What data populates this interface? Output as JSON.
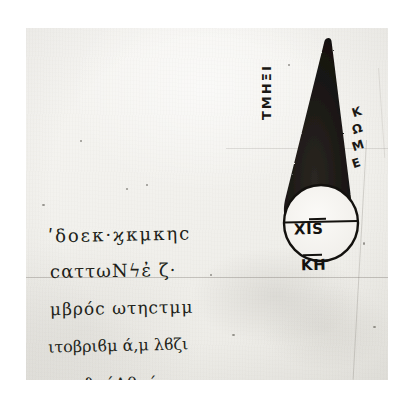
{
  "document": {
    "kind": "manuscript-scan",
    "description": "Photographic reproduction of a Greek manuscript folio showing a geometric cone diagram with a circular base and marginal annotations"
  },
  "figure": {
    "name": "cone-diagram",
    "shape": "cone",
    "fill_color": "#1b1815",
    "outline_color": "#100e0c",
    "base": {
      "shape": "circle",
      "fill_color": "#f6f4f0",
      "diameter_line": true,
      "labels": {
        "upper": "ΧΙS",
        "lower": "ΚΗ",
        "upper_has_overline": true,
        "lower_has_overline": true
      }
    },
    "annotations": {
      "left_vertical": "ΤΜΗΞΙ",
      "right_vertical": [
        "Κ",
        "Ω",
        "Μ",
        "Ε"
      ]
    }
  },
  "manuscript_text": {
    "lines": [
      "ʹδοεκ·ϗκμκηϲ",
      "ϲαττωΝϟἐ ζ·",
      "μβρόϲ ωτηϲτμμ",
      "ιτοβριϐμ ά,μ λϐζι",
      "ταμϑηόΑθυήο"
    ]
  },
  "palette": {
    "paper": "#f3f2ee",
    "ink": "#211e18",
    "figure_fill": "#1b1815",
    "scan_margin": "#ffffff",
    "rule_line": "#5f5a52"
  }
}
